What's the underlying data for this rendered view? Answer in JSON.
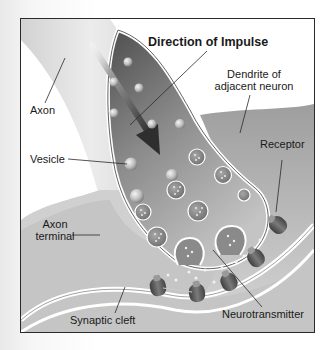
{
  "diagram": {
    "title": "Direction of Impulse",
    "labels": {
      "axon": "Axon",
      "vesicle": "Vesicle",
      "axon_terminal_line1": "Axon",
      "axon_terminal_line2": "terminal",
      "dendrite_line1": "Dendrite of",
      "dendrite_line2": "adjacent neuron",
      "receptor": "Receptor",
      "synaptic_cleft": "Synaptic cleft",
      "neurotransmitter": "Neurotransmitter"
    },
    "icons": {
      "arrow": "direction-arrow",
      "vesicle": "vesicle-sphere",
      "receptor": "receptor-protein"
    },
    "colors": {
      "frame": "#2a2a2a",
      "axon_fill": "#e2e2e2",
      "terminal_dark": "#5e5e5e",
      "terminal_light": "#bdbdbd",
      "dendrite_fill": "#b5b5b5",
      "membrane": "#ffffff",
      "arrow": "#3a3a3a",
      "receptor": "#555555"
    }
  }
}
